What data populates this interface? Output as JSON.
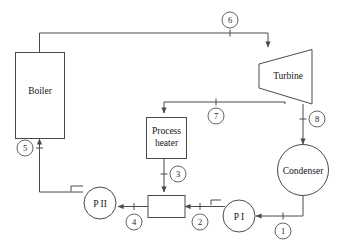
{
  "diagram": {
    "components": [
      {
        "id": "boiler",
        "label": "Boiler",
        "shape": "rectangle"
      },
      {
        "id": "turbine",
        "label": "Turbine",
        "shape": "trapezoid"
      },
      {
        "id": "process-heater",
        "label_line1": "Process",
        "label_line2": "heater",
        "shape": "rectangle"
      },
      {
        "id": "condenser",
        "label": "Condenser",
        "shape": "circle"
      },
      {
        "id": "pump-1",
        "label": "P I",
        "shape": "circle-pump"
      },
      {
        "id": "pump-2",
        "label": "P II",
        "shape": "circle-pump"
      },
      {
        "id": "mixing-chamber",
        "label": "",
        "shape": "rectangle"
      }
    ],
    "state_points": [
      {
        "id": "1",
        "label": "1"
      },
      {
        "id": "2",
        "label": "2"
      },
      {
        "id": "3",
        "label": "3"
      },
      {
        "id": "4",
        "label": "4"
      },
      {
        "id": "5",
        "label": "5"
      },
      {
        "id": "6",
        "label": "6"
      },
      {
        "id": "7",
        "label": "7"
      },
      {
        "id": "8",
        "label": "8"
      }
    ],
    "colors": {
      "line": "#4a4a4a",
      "text": "#151515",
      "background": "#ffffff",
      "circle_stroke": "#555555"
    }
  }
}
